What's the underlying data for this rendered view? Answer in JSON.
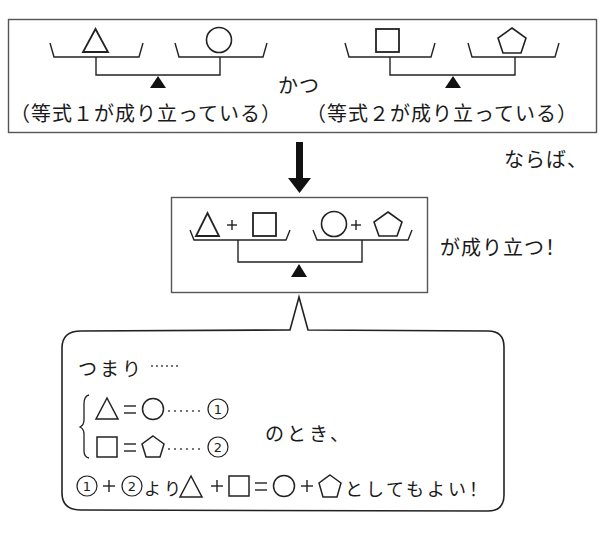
{
  "top_panel": {
    "scale1": {
      "left": "triangle",
      "right": "circle",
      "caption": "（等式１が成り立っている）"
    },
    "connector": "かつ",
    "scale2": {
      "left": "square",
      "right": "pentagon",
      "caption": "（等式２が成り立っている）"
    }
  },
  "conclusion_lead": "ならば、",
  "arrow": "down-arrow",
  "result_panel": {
    "left_pan": [
      "triangle",
      "+",
      "square"
    ],
    "right_pan": [
      "circle",
      "+",
      "pentagon"
    ],
    "caption": "が成り立つ！"
  },
  "speech_bubble": {
    "intro": "つまり……",
    "equation1": {
      "lhs": "triangle",
      "op": "=",
      "rhs": "circle",
      "dots": "……",
      "tag": "①"
    },
    "equation2": {
      "lhs": "square",
      "op": "=",
      "rhs": "pentagon",
      "dots": "……",
      "tag": "②"
    },
    "condition_suffix": "のとき、",
    "conclusion_prefix": "①+②より",
    "plus": "+",
    "equals": "=",
    "conclusion_suffix": "としてもよい！"
  }
}
